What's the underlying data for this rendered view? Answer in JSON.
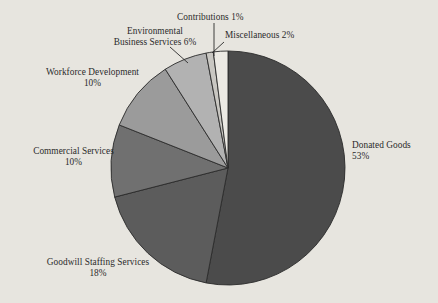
{
  "chart_data": {
    "type": "pie",
    "title": "",
    "subtitle": "",
    "xlabel": "",
    "ylabel": "",
    "legend_position": "none",
    "grid": false,
    "label_format": "name + percent",
    "start_angle_deg": 0,
    "direction": "clockwise",
    "units": "percent",
    "total": 100,
    "categories": [
      "Donated Goods",
      "Goodwill Staffing Services",
      "Commercial Services",
      "Workforce Development",
      "Environmental Business Services",
      "Contributions",
      "Miscellaneous"
    ],
    "values": [
      53,
      18,
      10,
      10,
      6,
      1,
      2
    ],
    "slices": [
      {
        "name": "Donated Goods",
        "value": 53,
        "percent_label": "53%",
        "color": "#4b4b4b",
        "label_lines": [
          "Donated Goods",
          "53%"
        ],
        "leader_line": false
      },
      {
        "name": "Goodwill Staffing Services",
        "value": 18,
        "percent_label": "18%",
        "color": "#5c5c5c",
        "label_lines": [
          "Goodwill Staffing Services",
          "18%"
        ],
        "leader_line": false
      },
      {
        "name": "Commercial Services",
        "value": 10,
        "percent_label": "10%",
        "color": "#707070",
        "label_lines": [
          "Commercial Services",
          "10%"
        ],
        "leader_line": false
      },
      {
        "name": "Workforce Development",
        "value": 10,
        "percent_label": "10%",
        "color": "#9b9b9b",
        "label_lines": [
          "Workforce Development",
          "10%"
        ],
        "leader_line": false
      },
      {
        "name": "Environmental Business Services",
        "value": 6,
        "percent_label": "6%",
        "color": "#b2b2b2",
        "label_lines": [
          "Environmental",
          "Business Services 6%"
        ],
        "leader_line": true
      },
      {
        "name": "Contributions",
        "value": 1,
        "percent_label": "1%",
        "color": "#c9c7c2",
        "label_lines": [
          "Contributions 1%"
        ],
        "leader_line": true
      },
      {
        "name": "Miscellaneous",
        "value": 2,
        "percent_label": "2%",
        "color": "#eceae4",
        "label_lines": [
          "Miscellaneous 2%"
        ],
        "leader_line": true
      }
    ],
    "colors": {
      "background": "#e7e5df",
      "text": "#2b2b2b",
      "slice_outline": "#2b2b2b",
      "leader_line": "#2b2b2b"
    }
  },
  "labels": {
    "donated_line1": "Donated Goods",
    "donated_line2": "53%",
    "goodwill_line1": "Goodwill Staffing Services",
    "goodwill_line2": "18%",
    "commercial_line1": "Commercial Services",
    "commercial_line2": "10%",
    "workforce_line1": "Workforce Development",
    "workforce_line2": "10%",
    "environmental_line1": "Environmental",
    "environmental_line2": "Business Services 6%",
    "contributions_line1": "Contributions 1%",
    "miscellaneous_line1": "Miscellaneous 2%"
  }
}
